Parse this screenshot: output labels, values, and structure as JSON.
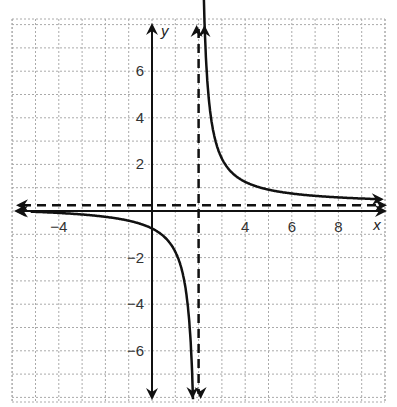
{
  "chart_data": {
    "type": "line",
    "title": "",
    "xlabel": "x",
    "ylabel": "y",
    "xlim": [
      -6,
      10
    ],
    "ylim": [
      -8.4,
      8
    ],
    "grid": true,
    "x_ticks": [
      -4,
      4,
      6,
      8
    ],
    "x_tick_labels": [
      "−4",
      "4",
      "6",
      "8"
    ],
    "y_ticks": [
      6,
      4,
      2,
      -2,
      -4,
      -6
    ],
    "y_tick_labels": [
      "6",
      "4",
      "2",
      "−2",
      "−4",
      "−6"
    ],
    "function": "y = 2/(x - 2) + 0.25",
    "asymptotes": {
      "vertical": {
        "x": 2,
        "style": "dashed"
      },
      "horizontal": {
        "y": 0.25,
        "style": "dashed"
      }
    },
    "series": [
      {
        "name": "right branch",
        "x": [
          2.25,
          2.5,
          3,
          4,
          5,
          6,
          7,
          8,
          9
        ],
        "y": [
          8.25,
          4.25,
          2.25,
          1.25,
          0.92,
          0.75,
          0.65,
          0.58,
          0.54
        ]
      },
      {
        "name": "left branch",
        "x": [
          -5,
          -4,
          -3,
          -2,
          -1,
          0,
          1,
          1.5,
          1.75
        ],
        "y": [
          -0.04,
          -0.08,
          -0.15,
          -0.25,
          -0.42,
          -0.75,
          -1.75,
          -3.75,
          -7.75
        ]
      }
    ],
    "colors": {
      "curve": "#111111",
      "grid": "#aaaaaa",
      "axis": "#111111"
    }
  }
}
